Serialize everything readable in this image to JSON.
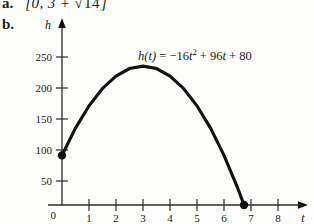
{
  "parts": {
    "a": {
      "label": "a.",
      "answer_open": "[0, 3 +",
      "answer_radicand": "14",
      "answer_close": "]"
    },
    "b": {
      "label": "b."
    }
  },
  "equation": {
    "lhs": "h(t)",
    "eq": "=",
    "term1_coef": "−16",
    "term1_var": "t",
    "term1_exp": "2",
    "op1": "+",
    "term2_coef": "96",
    "term2_var": "t",
    "op2": "+",
    "term3": "80",
    "full": "h(t) = −16t² + 96t + 80"
  },
  "chart_data": {
    "type": "line",
    "title": "",
    "xlabel": "t",
    "ylabel": "h",
    "xlim": [
      0,
      8.6
    ],
    "ylim": [
      0,
      280
    ],
    "grid": false,
    "legend": null,
    "x_ticks": [
      1,
      2,
      3,
      4,
      5,
      6,
      7,
      8
    ],
    "x_tick_labels": [
      "1",
      "2",
      "3",
      "4",
      "5",
      "6",
      "7",
      "8"
    ],
    "y_ticks": [
      50,
      100,
      150,
      200,
      250
    ],
    "y_tick_labels": [
      "50",
      "100",
      "150",
      "200",
      "250"
    ],
    "origin_label": "0",
    "function": "h(t) = -16t^2 + 96t + 80",
    "domain": [
      0,
      6.7417
    ],
    "endpoints": [
      {
        "x": 0,
        "y": 80,
        "marker": "filled-circle"
      },
      {
        "x": 6.7417,
        "y": 0,
        "marker": "filled-circle"
      }
    ],
    "vertex": {
      "x": 3,
      "y": 224
    },
    "series": [
      {
        "name": "h(t)",
        "x": [
          0,
          0.5,
          1,
          1.5,
          2,
          2.5,
          3,
          3.5,
          4,
          4.5,
          5,
          5.5,
          6,
          6.5,
          6.7417
        ],
        "values": [
          80,
          124,
          160,
          188,
          208,
          220,
          224,
          220,
          208,
          188,
          160,
          124,
          80,
          28,
          0
        ]
      }
    ]
  }
}
